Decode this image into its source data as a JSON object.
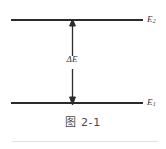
{
  "figure": {
    "caption": "图 2-1",
    "caption_cjk": "图",
    "caption_number": "2-1",
    "levels": [
      {
        "id": "upper",
        "label_base": "E",
        "label_sub": "2",
        "label_full": "E2",
        "position": "top"
      },
      {
        "id": "lower",
        "label_base": "E",
        "label_sub": "1",
        "label_full": "E1",
        "position": "bottom"
      }
    ],
    "transition": {
      "label_base": "ΔE",
      "label_full": "ΔE",
      "arrow_style": "double-headed-vertical",
      "arrow_icon": "up-down-arrow-icon"
    },
    "colors": {
      "line": "#2b2b2b",
      "text": "#3a3a3a",
      "caption": "#4a4a4a",
      "rule": "#e2e2e2",
      "background": "#ffffff"
    }
  }
}
